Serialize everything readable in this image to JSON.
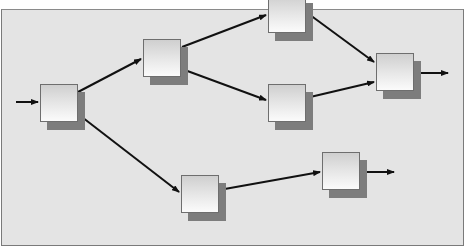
{
  "diagram": {
    "type": "flow-network",
    "background_color": "#e4e4e4",
    "node_count": 7,
    "nodes": [
      {
        "id": "n1",
        "x": 40,
        "y": 84
      },
      {
        "id": "n2",
        "x": 143,
        "y": 39
      },
      {
        "id": "n3",
        "x": 268,
        "y": -5
      },
      {
        "id": "n4",
        "x": 268,
        "y": 84
      },
      {
        "id": "n5",
        "x": 376,
        "y": 53
      },
      {
        "id": "n6",
        "x": 181,
        "y": 175
      },
      {
        "id": "n7",
        "x": 322,
        "y": 152
      }
    ],
    "edges": [
      {
        "from": "input",
        "to": "n1"
      },
      {
        "from": "n1",
        "to": "n2"
      },
      {
        "from": "n1",
        "to": "n6"
      },
      {
        "from": "n2",
        "to": "n3"
      },
      {
        "from": "n2",
        "to": "n4"
      },
      {
        "from": "n3",
        "to": "n5"
      },
      {
        "from": "n4",
        "to": "n5"
      },
      {
        "from": "n6",
        "to": "n7"
      },
      {
        "from": "n5",
        "to": "output"
      },
      {
        "from": "n7",
        "to": "output"
      }
    ]
  }
}
